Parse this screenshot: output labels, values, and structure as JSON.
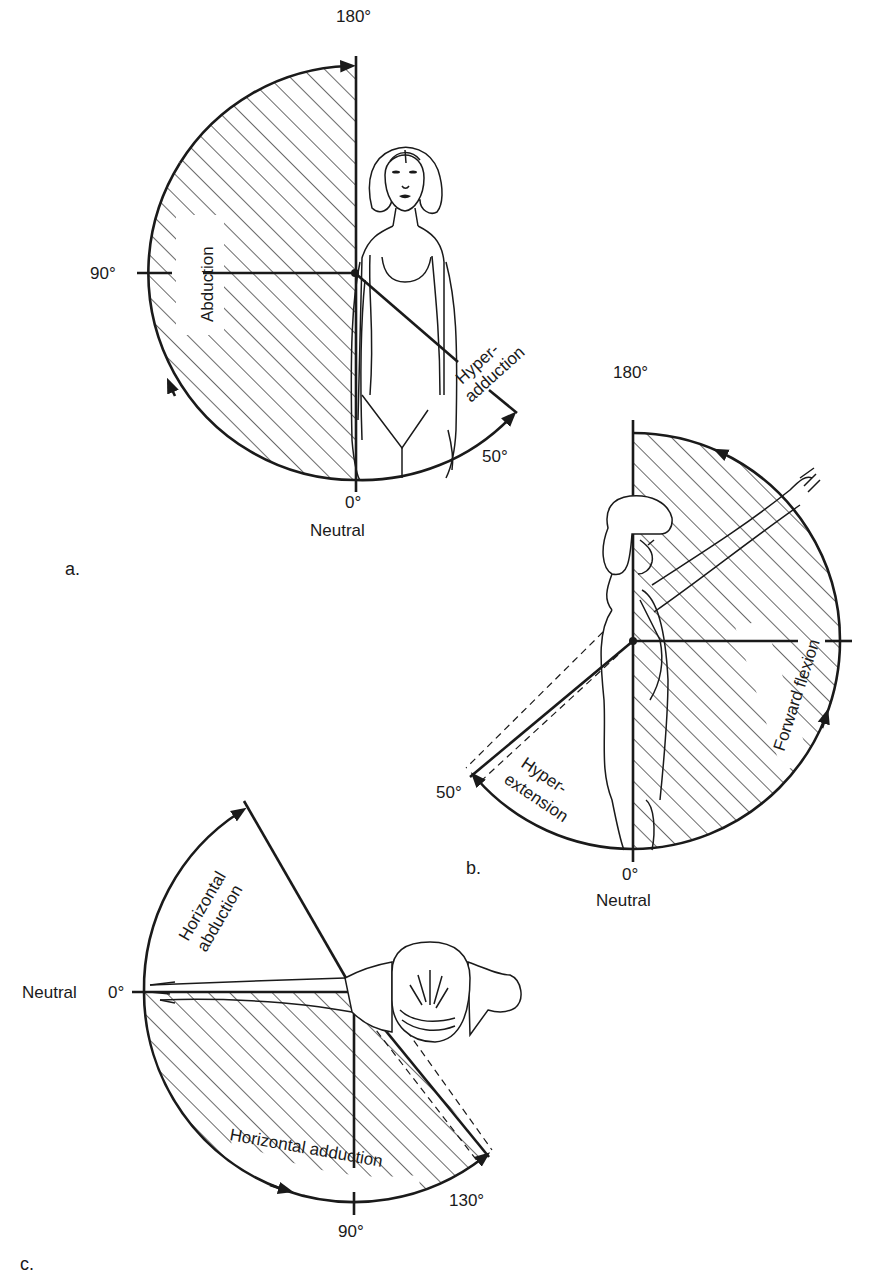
{
  "figure": {
    "panels": [
      {
        "id": "a",
        "caption": "a.",
        "motion": "Shoulder abduction / hyperadduction (frontal view)",
        "labels": {
          "top": "180°",
          "left": "90°",
          "bottom": "0°",
          "neutral": "Neutral",
          "end": "50°",
          "main_motion": "Abduction",
          "secondary_motion_line1": "Hyper-",
          "secondary_motion_line2": "adduction"
        },
        "ranges": {
          "abduction_deg": 180,
          "hyperadduction_deg": 50
        }
      },
      {
        "id": "b",
        "caption": "b.",
        "motion": "Shoulder forward flexion / hyperextension (side view)",
        "labels": {
          "top": "180°",
          "bottom": "0°",
          "neutral": "Neutral",
          "end": "50°",
          "main_motion": "Forward flexion",
          "secondary_motion_line1": "Hyper-",
          "secondary_motion_line2": "extension"
        },
        "ranges": {
          "forward_flexion_deg": 180,
          "hyperextension_deg": 50
        }
      },
      {
        "id": "c",
        "caption": "c.",
        "motion": "Horizontal abduction / adduction (top view)",
        "labels": {
          "neutral": "Neutral",
          "start": "0°",
          "bottom": "90°",
          "end": "130°",
          "main_motion": "Horizontal adduction",
          "secondary_motion_line1": "Horizontal",
          "secondary_motion_line2": "abduction"
        },
        "ranges": {
          "horizontal_adduction_deg": 130,
          "horizontal_abduction_deg": 60
        }
      }
    ],
    "colors": {
      "ink": "#1a1a1a",
      "background": "#ffffff"
    }
  }
}
